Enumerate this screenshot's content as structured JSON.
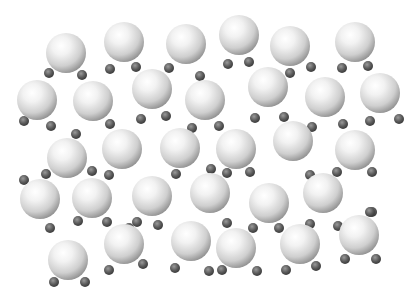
{
  "image": {
    "subject": "Array of molecules drawn as shaded spheres",
    "background": "#ffffff",
    "large_sphere_radius": 20,
    "small_sphere_radius": 5,
    "molecules": [
      {
        "c": [
          66,
          53
        ],
        "h": [
          [
            49,
            73
          ],
          [
            82,
            75
          ]
        ]
      },
      {
        "c": [
          124,
          42
        ],
        "h": [
          [
            110,
            69
          ],
          [
            136,
            67
          ]
        ]
      },
      {
        "c": [
          186,
          44
        ],
        "h": [
          [
            169,
            68
          ],
          [
            200,
            76
          ]
        ]
      },
      {
        "c": [
          239,
          35
        ],
        "h": [
          [
            228,
            64
          ],
          [
            249,
            62
          ]
        ]
      },
      {
        "c": [
          290,
          46
        ],
        "h": [
          [
            290,
            73
          ],
          [
            311,
            67
          ]
        ]
      },
      {
        "c": [
          355,
          42
        ],
        "h": [
          [
            342,
            68
          ],
          [
            368,
            66
          ]
        ]
      },
      {
        "c": [
          37,
          100
        ],
        "h": [
          [
            24,
            121
          ],
          [
            51,
            126
          ]
        ]
      },
      {
        "c": [
          93,
          101
        ],
        "h": [
          [
            76,
            134
          ],
          [
            110,
            124
          ]
        ]
      },
      {
        "c": [
          152,
          89
        ],
        "h": [
          [
            141,
            119
          ],
          [
            166,
            116
          ]
        ]
      },
      {
        "c": [
          205,
          100
        ],
        "h": [
          [
            219,
            126
          ],
          [
            192,
            128
          ]
        ]
      },
      {
        "c": [
          268,
          87
        ],
        "h": [
          [
            284,
            117
          ],
          [
            255,
            118
          ]
        ]
      },
      {
        "c": [
          325,
          97
        ],
        "h": [
          [
            343,
            124
          ],
          [
            312,
            127
          ]
        ]
      },
      {
        "c": [
          380,
          93
        ],
        "h": [
          [
            370,
            121
          ],
          [
            399,
            119
          ]
        ]
      },
      {
        "c": [
          67,
          158
        ],
        "h": [
          [
            24,
            180
          ],
          [
            46,
            174
          ]
        ]
      },
      {
        "c": [
          122,
          149
        ],
        "h": [
          [
            92,
            171
          ],
          [
            109,
            175
          ]
        ]
      },
      {
        "c": [
          180,
          148
        ],
        "h": [
          [
            176,
            174
          ],
          [
            211,
            169
          ]
        ]
      },
      {
        "c": [
          236,
          149
        ],
        "h": [
          [
            227,
            173
          ],
          [
            250,
            172
          ]
        ]
      },
      {
        "c": [
          293,
          141
        ],
        "h": [
          [
            337,
            172
          ],
          [
            372,
            172
          ]
        ]
      },
      {
        "c": [
          355,
          150
        ],
        "h": [
          [
            372,
            212
          ],
          [
            310,
            175
          ]
        ]
      },
      {
        "c": [
          40,
          199
        ],
        "h": [
          [
            50,
            228
          ],
          [
            78,
            221
          ]
        ]
      },
      {
        "c": [
          92,
          198
        ],
        "h": [
          [
            107,
            222
          ],
          [
            137,
            222
          ]
        ]
      },
      {
        "c": [
          152,
          196
        ],
        "h": [
          [
            158,
            225
          ],
          [
            129,
            228
          ]
        ]
      },
      {
        "c": [
          210,
          193
        ],
        "h": [
          [
            227,
            223
          ],
          [
            253,
            228
          ]
        ]
      },
      {
        "c": [
          269,
          203
        ],
        "h": [
          [
            279,
            228
          ],
          [
            310,
            224
          ]
        ]
      },
      {
        "c": [
          323,
          193
        ],
        "h": [
          [
            338,
            226
          ],
          [
            370,
            212
          ]
        ]
      },
      {
        "c": [
          68,
          260
        ],
        "h": [
          [
            54,
            282
          ],
          [
            85,
            282
          ]
        ]
      },
      {
        "c": [
          124,
          244
        ],
        "h": [
          [
            109,
            270
          ],
          [
            143,
            264
          ]
        ]
      },
      {
        "c": [
          191,
          241
        ],
        "h": [
          [
            175,
            268
          ],
          [
            209,
            271
          ]
        ]
      },
      {
        "c": [
          236,
          248
        ],
        "h": [
          [
            222,
            270
          ],
          [
            257,
            271
          ]
        ]
      },
      {
        "c": [
          300,
          244
        ],
        "h": [
          [
            286,
            270
          ],
          [
            316,
            266
          ]
        ]
      },
      {
        "c": [
          359,
          235
        ],
        "h": [
          [
            345,
            259
          ],
          [
            376,
            259
          ]
        ]
      }
    ]
  }
}
